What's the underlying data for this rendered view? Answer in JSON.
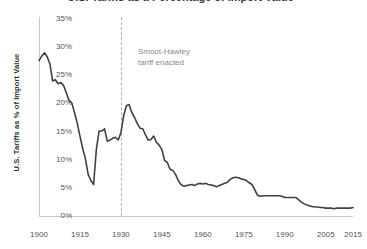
{
  "chart_data": {
    "type": "line",
    "title": "U.S. Tariffs as a Percentage of Import Value",
    "xlabel": "",
    "ylabel": "U.S. Tariffs as % of Import Value",
    "xlim": [
      1900,
      2015
    ],
    "ylim": [
      0,
      35
    ],
    "grid": false,
    "legend": "none",
    "y_tick_labels": [
      "35%",
      "30%",
      "25%",
      "20%",
      "15%",
      "10%",
      "5%",
      "0%"
    ],
    "y_tick_values": [
      35,
      30,
      25,
      20,
      15,
      10,
      5,
      0
    ],
    "x_tick_labels": [
      "1900",
      "1915",
      "1930",
      "1945",
      "1960",
      "1975",
      "1990",
      "2005",
      "2015"
    ],
    "x_tick_values": [
      1900,
      1915,
      1930,
      1945,
      1960,
      1975,
      1990,
      2005,
      2015
    ],
    "annotations": [
      {
        "name": "smoot-hawley",
        "line1": "Smoot-Hawley",
        "line2": "tariff enacted",
        "x": 1930,
        "style": "vertical-dashed-line"
      }
    ],
    "series": [
      {
        "name": "U.S. average tariff rate",
        "color": "#404040",
        "x": [
          1900,
          1901,
          1902,
          1903,
          1904,
          1905,
          1906,
          1907,
          1908,
          1909,
          1910,
          1911,
          1912,
          1913,
          1914,
          1915,
          1916,
          1917,
          1918,
          1919,
          1920,
          1921,
          1922,
          1923,
          1924,
          1925,
          1926,
          1927,
          1928,
          1929,
          1930,
          1931,
          1932,
          1933,
          1934,
          1935,
          1936,
          1937,
          1938,
          1939,
          1940,
          1941,
          1942,
          1943,
          1944,
          1945,
          1946,
          1947,
          1948,
          1949,
          1950,
          1951,
          1952,
          1953,
          1954,
          1955,
          1956,
          1957,
          1958,
          1959,
          1960,
          1961,
          1962,
          1963,
          1964,
          1965,
          1966,
          1967,
          1968,
          1969,
          1970,
          1971,
          1972,
          1973,
          1974,
          1975,
          1976,
          1977,
          1978,
          1979,
          1980,
          1981,
          1982,
          1983,
          1984,
          1985,
          1986,
          1987,
          1988,
          1989,
          1990,
          1991,
          1992,
          1993,
          1994,
          1995,
          1996,
          1997,
          1998,
          1999,
          2000,
          2001,
          2002,
          2003,
          2004,
          2005,
          2006,
          2007,
          2008,
          2009,
          2010,
          2011,
          2012,
          2013,
          2014,
          2015
        ],
        "values": [
          27.6,
          28.4,
          29.0,
          28.3,
          27.0,
          24.0,
          24.2,
          23.5,
          23.7,
          23.2,
          21.9,
          20.5,
          20.1,
          18.4,
          16.5,
          14.2,
          12.0,
          10.2,
          7.4,
          6.3,
          5.6,
          11.8,
          15.1,
          15.1,
          15.5,
          13.3,
          13.5,
          13.8,
          14.0,
          13.5,
          14.8,
          17.8,
          19.6,
          19.8,
          18.4,
          17.5,
          16.4,
          15.6,
          15.5,
          14.4,
          13.5,
          13.6,
          14.2,
          13.1,
          12.6,
          11.8,
          9.9,
          9.5,
          8.3,
          8.1,
          7.4,
          6.3,
          5.6,
          5.3,
          5.4,
          5.5,
          5.6,
          5.4,
          5.7,
          5.8,
          5.7,
          5.8,
          5.6,
          5.5,
          5.4,
          5.2,
          5.4,
          5.6,
          5.8,
          6.0,
          6.5,
          6.8,
          6.9,
          6.8,
          6.6,
          6.5,
          6.3,
          5.9,
          5.6,
          4.7,
          3.7,
          3.5,
          3.6,
          3.6,
          3.6,
          3.6,
          3.6,
          3.6,
          3.6,
          3.5,
          3.3,
          3.3,
          3.3,
          3.3,
          3.3,
          2.9,
          2.5,
          2.2,
          2.0,
          1.8,
          1.7,
          1.6,
          1.6,
          1.5,
          1.5,
          1.4,
          1.4,
          1.4,
          1.3,
          1.4,
          1.4,
          1.4,
          1.4,
          1.4,
          1.4,
          1.5
        ]
      }
    ]
  }
}
